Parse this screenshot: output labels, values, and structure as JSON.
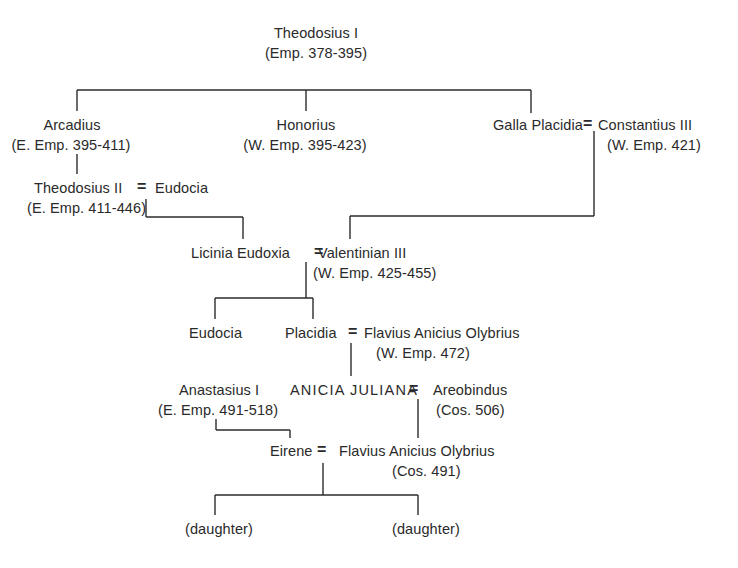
{
  "persons": {
    "theodosius1": {
      "name": "Theodosius I",
      "note": "(Emp. 378-395)"
    },
    "arcadius": {
      "name": "Arcadius",
      "note": "(E. Emp. 395-411)"
    },
    "honorius": {
      "name": "Honorius",
      "note": "(W. Emp. 395-423)"
    },
    "galla_placidia": {
      "name": "Galla Placidia"
    },
    "constantius3": {
      "name": "Constantius III",
      "note": "(W. Emp. 421)"
    },
    "theodosius2": {
      "name": "Theodosius II",
      "note": "(E. Emp. 411-446)"
    },
    "eudocia_wife": {
      "name": "Eudocia"
    },
    "licinia_eudoxia": {
      "name": "Licinia Eudoxia"
    },
    "valentinian3": {
      "name": "Valentinian III",
      "note": "(W. Emp. 425-455)"
    },
    "eudocia_daughter": {
      "name": "Eudocia"
    },
    "placidia": {
      "name": "Placidia"
    },
    "olybrius_emp": {
      "name": "Flavius Anicius Olybrius",
      "note": "(W. Emp. 472)"
    },
    "anicia_juliana": {
      "name": "ANICIA  JULIANA"
    },
    "areobindus": {
      "name": "Areobindus",
      "note": "(Cos. 506)"
    },
    "anastasius1": {
      "name": "Anastasius I",
      "note": "(E. Emp. 491-518)"
    },
    "eirene": {
      "name": "Eirene"
    },
    "olybrius_cos": {
      "name": "Flavius Anicius Olybrius",
      "note": "(Cos. 491)"
    },
    "daughter1": {
      "name": "(daughter)"
    },
    "daughter2": {
      "name": "(daughter)"
    }
  },
  "marriage_symbol": "=",
  "relations": {
    "marriages": [
      [
        "galla_placidia",
        "constantius3"
      ],
      [
        "theodosius2",
        "eudocia_wife"
      ],
      [
        "licinia_eudoxia",
        "valentinian3"
      ],
      [
        "placidia",
        "olybrius_emp"
      ],
      [
        "anicia_juliana",
        "areobindus"
      ],
      [
        "eirene",
        "olybrius_cos"
      ]
    ],
    "descents": [
      [
        "theodosius1",
        [
          "arcadius",
          "honorius",
          "galla_placidia"
        ]
      ],
      [
        "arcadius",
        [
          "theodosius2"
        ]
      ],
      [
        "theodosius2+eudocia_wife",
        [
          "licinia_eudoxia"
        ]
      ],
      [
        "galla_placidia+constantius3",
        [
          "valentinian3"
        ]
      ],
      [
        "licinia_eudoxia+valentinian3",
        [
          "eudocia_daughter",
          "placidia"
        ]
      ],
      [
        "placidia+olybrius_emp",
        [
          "anicia_juliana"
        ]
      ],
      [
        "anicia_juliana+areobindus",
        [
          "olybrius_cos"
        ]
      ],
      [
        "anastasius1",
        [
          "eirene"
        ]
      ],
      [
        "eirene+olybrius_cos",
        [
          "daughter1",
          "daughter2"
        ]
      ]
    ]
  }
}
